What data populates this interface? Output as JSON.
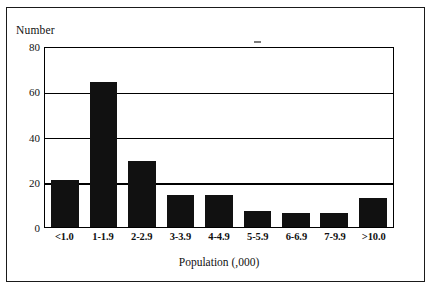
{
  "figure": {
    "background_color": "#ffffff",
    "frame_color": "#1a1a1a",
    "bar_color": "#111111"
  },
  "chart_data": {
    "type": "bar",
    "title": "",
    "subtitle": "",
    "xlabel": "Population (,000)",
    "ylabel": "Number",
    "categories": [
      "<1.0",
      "1-1.9",
      "2-2.9",
      "3-3.9",
      "4-4.9",
      "5-5.9",
      "6-6.9",
      "7-9.9",
      ">10.0"
    ],
    "values": [
      21,
      64,
      29,
      14,
      14,
      7,
      6,
      6,
      13
    ],
    "ylim": [
      0,
      80
    ],
    "yticks": [
      0,
      20,
      40,
      60,
      80
    ],
    "ytick_labels": [
      "0",
      "20",
      "40",
      "60",
      "80"
    ],
    "grid": "horizontal",
    "legend": "none"
  },
  "axes": {
    "y_title": "Number",
    "x_title": "Population (,000)",
    "y_ticks": [
      {
        "label": "80",
        "value": 80
      },
      {
        "label": "60",
        "value": 60
      },
      {
        "label": "40",
        "value": 40
      },
      {
        "label": "20",
        "value": 20
      },
      {
        "label": "0",
        "value": 0
      }
    ],
    "x_ticks": [
      {
        "label": "<1.0"
      },
      {
        "label": "1-1.9"
      },
      {
        "label": "2-2.9"
      },
      {
        "label": "3-3.9"
      },
      {
        "label": "4-4.9"
      },
      {
        "label": "5-5.9"
      },
      {
        "label": "6-6.9"
      },
      {
        "label": "7-9.9"
      },
      {
        "label": ">10.0"
      }
    ]
  }
}
